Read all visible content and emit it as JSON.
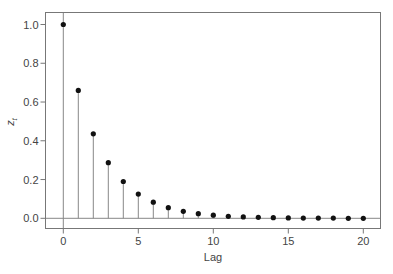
{
  "chart_data": {
    "type": "stem",
    "title": "",
    "xlabel": "Lag",
    "ylabel": "z_t",
    "ylabel_main": "z",
    "ylabel_sub": "t",
    "xlim": [
      -1.2,
      21.2
    ],
    "ylim": [
      -0.05,
      1.06
    ],
    "grid": false,
    "legend": null,
    "x_ticks": [
      0,
      5,
      10,
      15,
      20
    ],
    "x_tick_labels": [
      "0",
      "5",
      "10",
      "15",
      "20"
    ],
    "y_ticks": [
      0.0,
      0.2,
      0.4,
      0.6,
      0.8,
      1.0
    ],
    "y_tick_labels": [
      "0.0",
      "0.2",
      "0.4",
      "0.6",
      "0.8",
      "1.0"
    ],
    "x": [
      0,
      1,
      2,
      3,
      4,
      5,
      6,
      7,
      8,
      9,
      10,
      11,
      12,
      13,
      14,
      15,
      16,
      17,
      18,
      19,
      20
    ],
    "values": [
      1.0,
      0.66,
      0.436,
      0.287,
      0.19,
      0.125,
      0.083,
      0.055,
      0.036,
      0.024,
      0.016,
      0.01,
      0.007,
      0.005,
      0.003,
      0.002,
      0.001,
      0.001,
      0.001,
      0.0,
      0.0
    ],
    "reference_line_y": 0.0,
    "colors": {
      "marker": "#111111",
      "stem": "#888888",
      "axis": "#777777",
      "text": "#444444"
    }
  }
}
